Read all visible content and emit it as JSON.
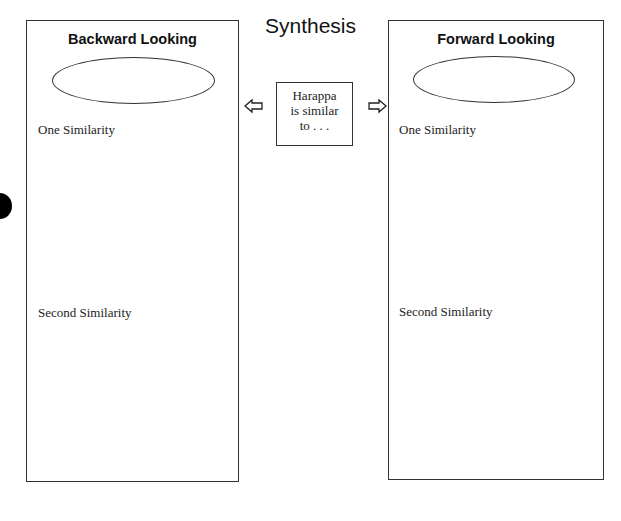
{
  "title": "Synthesis",
  "center": {
    "lines": [
      "Harappa",
      "is similar",
      "to . . ."
    ]
  },
  "panels": [
    {
      "heading": "Backward Looking",
      "first_label": "One Similarity",
      "second_label": "Second Similarity"
    },
    {
      "heading": "Forward Looking",
      "first_label": "One Similarity",
      "second_label": "Second Similarity"
    }
  ],
  "icons": {
    "left_arrow": "arrow-left-outline",
    "right_arrow": "arrow-right-outline",
    "margin_dot": "filled-circle"
  }
}
